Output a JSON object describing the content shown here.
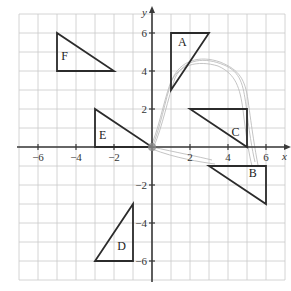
{
  "diagram": {
    "type": "coordinate-grid",
    "x_axis": {
      "label": "x",
      "range": [
        -7,
        7
      ],
      "tick_labels": [
        "−6",
        "−4",
        "−2",
        "2",
        "4",
        "6"
      ],
      "tick_values": [
        -6,
        -4,
        -2,
        2,
        4,
        6
      ]
    },
    "y_axis": {
      "label": "y",
      "range": [
        -7,
        7
      ],
      "tick_labels": [
        "6",
        "4",
        "2",
        "−2",
        "−4",
        "−6"
      ],
      "tick_values": [
        6,
        4,
        2,
        -2,
        -4,
        -6
      ]
    },
    "grid": true,
    "triangles": [
      {
        "name": "A",
        "vertices": [
          [
            1,
            6
          ],
          [
            3,
            6
          ],
          [
            1,
            3
          ]
        ],
        "label_at": [
          1.6,
          5.3
        ]
      },
      {
        "name": "B",
        "vertices": [
          [
            3,
            -1
          ],
          [
            6,
            -1
          ],
          [
            6,
            -3
          ]
        ],
        "label_at": [
          5.3,
          -1.6
        ]
      },
      {
        "name": "C",
        "vertices": [
          [
            2,
            2
          ],
          [
            5,
            2
          ],
          [
            5,
            0
          ]
        ],
        "label_at": [
          4.4,
          0.6
        ]
      },
      {
        "name": "D",
        "vertices": [
          [
            -1,
            -3
          ],
          [
            -1,
            -6
          ],
          [
            -3,
            -6
          ]
        ],
        "label_at": [
          -1.6,
          -5.4
        ]
      },
      {
        "name": "E",
        "vertices": [
          [
            -3,
            2
          ],
          [
            -3,
            0
          ],
          [
            0,
            0
          ]
        ],
        "label_at": [
          -2.6,
          0.4
        ]
      },
      {
        "name": "F",
        "vertices": [
          [
            -5,
            6
          ],
          [
            -5,
            4
          ],
          [
            -2,
            4
          ]
        ],
        "label_at": [
          -4.6,
          4.6
        ]
      }
    ],
    "colors": {
      "grid": "#c9c9c9",
      "axis": "#3a3a3a",
      "triangle": "#2b2b2b",
      "pencil": "#bdbdbd"
    }
  }
}
